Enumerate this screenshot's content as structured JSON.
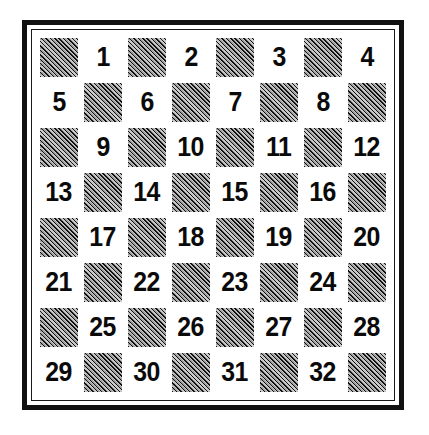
{
  "diagram": {
    "type": "checkerboard-numbering-diagram",
    "rows": 8,
    "columns": 8,
    "playable_squares": 32,
    "colors": {
      "page_background": "#ffffff",
      "frame": "#111111",
      "light_square": "#ffffff",
      "dark_square_hatch": "#111111",
      "dark_square_fill": "#c9c9c9",
      "number_text": "#0a0a0a"
    },
    "legend": {
      "dark_square_style": "diagonal-hatch",
      "light_square_style": "plain-white",
      "numbers_placed_on": "light squares"
    }
  },
  "board": {
    "rows": [
      {
        "index": 1,
        "cells": [
          {
            "shade": "dark",
            "label": ""
          },
          {
            "shade": "light",
            "label": "1"
          },
          {
            "shade": "dark",
            "label": ""
          },
          {
            "shade": "light",
            "label": "2"
          },
          {
            "shade": "dark",
            "label": ""
          },
          {
            "shade": "light",
            "label": "3"
          },
          {
            "shade": "dark",
            "label": ""
          },
          {
            "shade": "light",
            "label": "4"
          }
        ]
      },
      {
        "index": 2,
        "cells": [
          {
            "shade": "light",
            "label": "5"
          },
          {
            "shade": "dark",
            "label": ""
          },
          {
            "shade": "light",
            "label": "6"
          },
          {
            "shade": "dark",
            "label": ""
          },
          {
            "shade": "light",
            "label": "7"
          },
          {
            "shade": "dark",
            "label": ""
          },
          {
            "shade": "light",
            "label": "8"
          },
          {
            "shade": "dark",
            "label": ""
          }
        ]
      },
      {
        "index": 3,
        "cells": [
          {
            "shade": "dark",
            "label": ""
          },
          {
            "shade": "light",
            "label": "9"
          },
          {
            "shade": "dark",
            "label": ""
          },
          {
            "shade": "light",
            "label": "10"
          },
          {
            "shade": "dark",
            "label": ""
          },
          {
            "shade": "light",
            "label": "11"
          },
          {
            "shade": "dark",
            "label": ""
          },
          {
            "shade": "light",
            "label": "12"
          }
        ]
      },
      {
        "index": 4,
        "cells": [
          {
            "shade": "light",
            "label": "13"
          },
          {
            "shade": "dark",
            "label": ""
          },
          {
            "shade": "light",
            "label": "14"
          },
          {
            "shade": "dark",
            "label": ""
          },
          {
            "shade": "light",
            "label": "15"
          },
          {
            "shade": "dark",
            "label": ""
          },
          {
            "shade": "light",
            "label": "16"
          },
          {
            "shade": "dark",
            "label": ""
          }
        ]
      },
      {
        "index": 5,
        "cells": [
          {
            "shade": "dark",
            "label": ""
          },
          {
            "shade": "light",
            "label": "17"
          },
          {
            "shade": "dark",
            "label": ""
          },
          {
            "shade": "light",
            "label": "18"
          },
          {
            "shade": "dark",
            "label": ""
          },
          {
            "shade": "light",
            "label": "19"
          },
          {
            "shade": "dark",
            "label": ""
          },
          {
            "shade": "light",
            "label": "20"
          }
        ]
      },
      {
        "index": 6,
        "cells": [
          {
            "shade": "light",
            "label": "21"
          },
          {
            "shade": "dark",
            "label": ""
          },
          {
            "shade": "light",
            "label": "22"
          },
          {
            "shade": "dark",
            "label": ""
          },
          {
            "shade": "light",
            "label": "23"
          },
          {
            "shade": "dark",
            "label": ""
          },
          {
            "shade": "light",
            "label": "24"
          },
          {
            "shade": "dark",
            "label": ""
          }
        ]
      },
      {
        "index": 7,
        "cells": [
          {
            "shade": "dark",
            "label": ""
          },
          {
            "shade": "light",
            "label": "25"
          },
          {
            "shade": "dark",
            "label": ""
          },
          {
            "shade": "light",
            "label": "26"
          },
          {
            "shade": "dark",
            "label": ""
          },
          {
            "shade": "light",
            "label": "27"
          },
          {
            "shade": "dark",
            "label": ""
          },
          {
            "shade": "light",
            "label": "28"
          }
        ]
      },
      {
        "index": 8,
        "cells": [
          {
            "shade": "light",
            "label": "29"
          },
          {
            "shade": "dark",
            "label": ""
          },
          {
            "shade": "light",
            "label": "30"
          },
          {
            "shade": "dark",
            "label": ""
          },
          {
            "shade": "light",
            "label": "31"
          },
          {
            "shade": "dark",
            "label": ""
          },
          {
            "shade": "light",
            "label": "32"
          },
          {
            "shade": "dark",
            "label": ""
          }
        ]
      }
    ]
  }
}
